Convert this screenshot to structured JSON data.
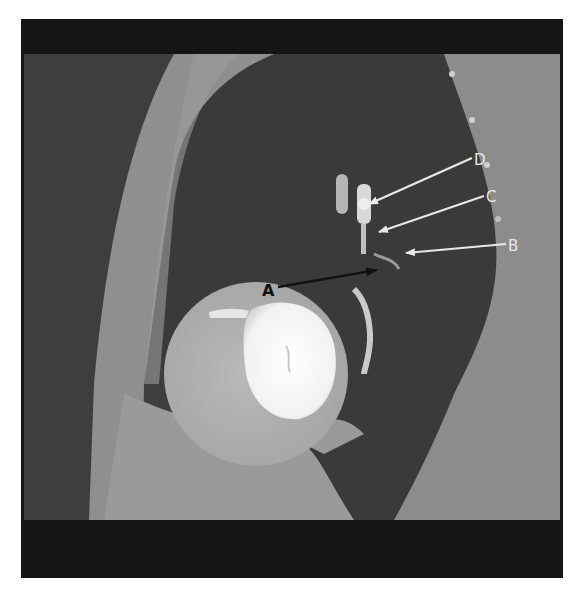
{
  "figure": {
    "type": "CT scan (sagittal view of thorax)",
    "frame_color": "#151515",
    "labels": [
      {
        "id": "A",
        "text": "A",
        "color": "#111111",
        "arrow_color": "#111111"
      },
      {
        "id": "B",
        "text": "B",
        "color": "#e8e8e8",
        "arrow_color": "#e8e8e8"
      },
      {
        "id": "C",
        "text": "C",
        "color": "#e8e8e8",
        "arrow_color": "#e8e8e8"
      },
      {
        "id": "D",
        "text": "D",
        "color": "#e8e8e8",
        "arrow_color": "#e8e8e8"
      }
    ]
  }
}
